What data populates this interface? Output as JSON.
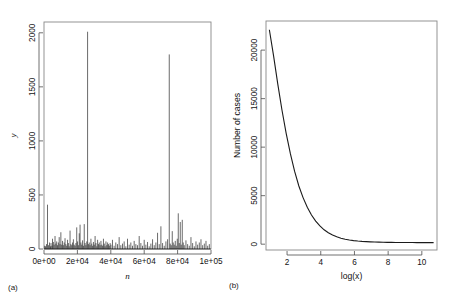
{
  "figure": {
    "panels": [
      {
        "id": "a",
        "caption": "(a)",
        "chart_ref": 0
      },
      {
        "id": "b",
        "caption": "(b)",
        "chart_ref": 1
      }
    ]
  },
  "chart_data": [
    {
      "type": "bar",
      "panel": "(a)",
      "title": "",
      "xlabel": "n",
      "ylabel": "y",
      "xlim": [
        0,
        100000
      ],
      "ylim": [
        0,
        2100
      ],
      "xticks": [
        0,
        20000,
        40000,
        60000,
        80000,
        100000
      ],
      "xticklabels": [
        "0e+00",
        "2e+04",
        "4e+04",
        "6e+04",
        "8e+04",
        "1e+05"
      ],
      "yticks": [
        0,
        500,
        1000,
        1500,
        2000
      ],
      "yticklabels": [
        "0",
        "500",
        "1000",
        "1500",
        "2000"
      ],
      "grid": false,
      "legend": null,
      "x": [
        400,
        900,
        1500,
        2100,
        2700,
        3300,
        3900,
        4200,
        4700,
        5100,
        5600,
        6100,
        6600,
        7100,
        7600,
        8100,
        8600,
        9100,
        9600,
        10100,
        10600,
        11100,
        11600,
        12100,
        12600,
        13100,
        13600,
        14100,
        14600,
        15100,
        15600,
        16100,
        16600,
        17100,
        17600,
        18100,
        18600,
        19100,
        19600,
        20100,
        20600,
        21100,
        21600,
        22100,
        22600,
        23100,
        23600,
        24100,
        24600,
        25100,
        25600,
        26100,
        26600,
        27100,
        27600,
        28100,
        28600,
        29100,
        29600,
        30100,
        30600,
        31100,
        31600,
        32100,
        32600,
        33100,
        33600,
        34100,
        34600,
        35100,
        35600,
        36100,
        36600,
        37100,
        37600,
        38100,
        38600,
        39100,
        39600,
        40100,
        41000,
        42000,
        43000,
        44000,
        45000,
        46000,
        47000,
        48000,
        49000,
        50000,
        51000,
        52000,
        53000,
        54000,
        55000,
        56000,
        57000,
        58000,
        59000,
        60000,
        61000,
        62000,
        63000,
        64000,
        65000,
        66000,
        67000,
        68000,
        69000,
        70000,
        71000,
        72000,
        73000,
        74000,
        75000,
        75600,
        76200,
        76800,
        77400,
        78000,
        78600,
        79200,
        79800,
        80400,
        81000,
        81600,
        82200,
        82800,
        83400,
        84000,
        85000,
        86000,
        87000,
        88000,
        89000,
        90000,
        91000,
        92000,
        93000,
        94000,
        95000,
        96000,
        97000,
        98000,
        99000
      ],
      "values": [
        30,
        25,
        45,
        410,
        35,
        60,
        25,
        55,
        30,
        95,
        65,
        40,
        120,
        50,
        70,
        35,
        60,
        110,
        45,
        155,
        40,
        75,
        35,
        60,
        100,
        45,
        30,
        85,
        55,
        25,
        170,
        45,
        35,
        60,
        90,
        40,
        30,
        55,
        200,
        70,
        35,
        145,
        225,
        60,
        40,
        80,
        30,
        230,
        55,
        35,
        70,
        2010,
        45,
        60,
        35,
        95,
        50,
        30,
        65,
        40,
        120,
        55,
        25,
        85,
        45,
        60,
        35,
        75,
        40,
        30,
        95,
        50,
        25,
        70,
        35,
        60,
        45,
        30,
        55,
        40,
        85,
        30,
        60,
        45,
        110,
        35,
        50,
        70,
        25,
        95,
        40,
        60,
        30,
        75,
        45,
        35,
        120,
        55,
        30,
        85,
        40,
        65,
        25,
        50,
        90,
        35,
        60,
        150,
        45,
        210,
        55,
        30,
        70,
        90,
        1800,
        50,
        35,
        165,
        60,
        40,
        75,
        30,
        95,
        330,
        55,
        250,
        40,
        270,
        60,
        35,
        80,
        45,
        30,
        110,
        55,
        25,
        70,
        40,
        60,
        90,
        35,
        50,
        75,
        30,
        45,
        60,
        35
      ]
    },
    {
      "type": "line",
      "panel": "(b)",
      "title": "",
      "xlabel": "log(x)",
      "ylabel": "Number of cases",
      "xlim": [
        0.75,
        10.9
      ],
      "ylim": [
        -600,
        23000
      ],
      "xticks": [
        2,
        4,
        6,
        8,
        10
      ],
      "xticklabels": [
        "2",
        "4",
        "6",
        "8",
        "10"
      ],
      "yticks": [
        0,
        5000,
        10000,
        15000,
        20000
      ],
      "yticklabels": [
        "0",
        "5000",
        "10000",
        "15000",
        "20000"
      ],
      "grid": false,
      "legend": null,
      "x": [
        0.95,
        1.2,
        1.45,
        1.7,
        1.95,
        2.2,
        2.45,
        2.7,
        2.95,
        3.2,
        3.45,
        3.7,
        3.95,
        4.2,
        4.45,
        4.7,
        4.95,
        5.2,
        5.45,
        5.7,
        5.95,
        6.2,
        6.45,
        6.7,
        6.95,
        7.2,
        7.45,
        7.7,
        7.95,
        8.2,
        8.45,
        8.7,
        8.95,
        9.2,
        9.45,
        9.7,
        9.95,
        10.2,
        10.45,
        10.7
      ],
      "values": [
        22100,
        19400,
        16500,
        13800,
        11400,
        9300,
        7500,
        6000,
        4800,
        3800,
        3000,
        2380,
        1880,
        1480,
        1180,
        940,
        760,
        620,
        510,
        430,
        370,
        322,
        285,
        258,
        236,
        220,
        208,
        198,
        190,
        184,
        179,
        175,
        172,
        169,
        167,
        165,
        163,
        161,
        160,
        159
      ]
    }
  ]
}
